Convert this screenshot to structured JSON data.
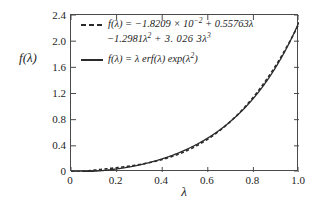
{
  "chart_data": {
    "type": "line",
    "title": "",
    "xlabel": "λ",
    "ylabel": "f(λ)",
    "xlim": [
      0,
      1.0
    ],
    "ylim": [
      0,
      2.4
    ],
    "xticks": [
      "0",
      "0.2",
      "0.4",
      "0.6",
      "0.8",
      "1.0"
    ],
    "xtick_values": [
      0,
      0.2,
      0.4,
      0.6,
      0.8,
      1.0
    ],
    "yticks": [
      "0",
      "0.4",
      "0.8",
      "1.2",
      "1.6",
      "2.0",
      "2.4"
    ],
    "ytick_values": [
      0,
      0.4,
      0.8,
      1.2,
      1.6,
      2.0,
      2.4
    ],
    "grid": false,
    "legend_position": "upper-left",
    "series": [
      {
        "name": "f(λ) = −1.8209 × 10⁻² + 0.55763λ −1.2981λ² + 3.0263λ³",
        "style": "dashed",
        "color": "#2b2b2b",
        "polynomial_coefficients": [
          -0.018209,
          0.55763,
          -1.2981,
          3.0263
        ],
        "x": [
          0,
          0.05,
          0.1,
          0.15,
          0.2,
          0.25,
          0.3,
          0.35,
          0.4,
          0.45,
          0.5,
          0.55,
          0.6,
          0.65,
          0.7,
          0.75,
          0.8,
          0.85,
          0.9,
          0.95,
          1.0
        ],
        "values": [
          -0.018,
          0.007,
          0.025,
          0.044,
          0.068,
          0.101,
          0.146,
          0.207,
          0.287,
          0.389,
          0.517,
          0.673,
          0.862,
          1.085,
          1.347,
          1.651,
          2.0,
          2.397,
          2.846,
          3.35,
          3.913
        ]
      },
      {
        "name": "f(λ) = λ erf(λ) exp(λ²)",
        "style": "solid",
        "color": "#2b2b2b",
        "x": [
          0,
          0.05,
          0.1,
          0.15,
          0.2,
          0.25,
          0.3,
          0.35,
          0.4,
          0.45,
          0.5,
          0.55,
          0.6,
          0.65,
          0.7,
          0.75,
          0.8,
          0.85,
          0.9,
          0.95,
          1.0
        ],
        "values": [
          0,
          0.0028,
          0.0114,
          0.0258,
          0.0468,
          0.0742,
          0.1092,
          0.1524,
          0.2052,
          0.2688,
          0.345,
          0.4354,
          0.5424,
          0.6684,
          0.8166,
          0.9906,
          1.1946,
          1.4338,
          1.714,
          2.042,
          2.4258
        ]
      }
    ],
    "legend": {
      "entries": [
        {
          "style": "dashed",
          "line1_prefix": "f(λ) = −1.8209 × 10",
          "line1_exponent": "−2",
          "line1_suffix": " + 0.55763λ",
          "line2_prefix": "−1.2981λ",
          "line2_exp1": "2",
          "line2_mid": " + 3. 026 3λ",
          "line2_exp2": "3"
        },
        {
          "style": "solid",
          "line1_prefix": "f(λ) = λ erf(λ) exp(λ",
          "line1_exponent": "2",
          "line1_suffix": ")"
        }
      ]
    }
  }
}
